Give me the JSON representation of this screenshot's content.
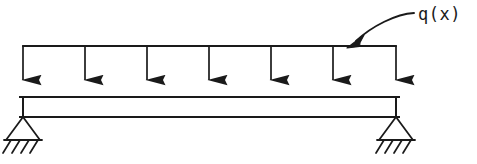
{
  "figure": {
    "kind": "structural-engineering-beam-diagram",
    "background_color": "#ffffff",
    "ink_color": "#1a1a1a"
  },
  "annotations": {
    "load_label": "q(x)",
    "load_label_x": 418,
    "load_label_y": 6
  },
  "beam": {
    "name": "beam",
    "left_x": 23,
    "right_x": 396,
    "top_y": 97,
    "bottom_y": 117,
    "stroke_width": 2.0
  },
  "load": {
    "name": "uniformly-distributed-load",
    "symbol": "q(x)",
    "distribution": "uniform",
    "direction": "downward",
    "top_line_y": 46,
    "left_x": 23,
    "right_x": 396,
    "arrow_count": 7,
    "arrow_x_positions": [
      23,
      85,
      147,
      209,
      271,
      333,
      396
    ],
    "arrow_tip_y": 97,
    "arrow_head_width": 11,
    "arrow_head_height": 20,
    "stroke_width": 1.6
  },
  "supports": [
    {
      "name": "support-left",
      "type": "pinned",
      "apex_x": 23,
      "apex_y": 117,
      "half_width": 17,
      "height": 23,
      "ground_y": 140,
      "hatch_count": 4,
      "hatch_length": 14,
      "hatch_angle_dx": -9
    },
    {
      "name": "support-right",
      "type": "pinned",
      "apex_x": 396,
      "apex_y": 117,
      "half_width": 17,
      "height": 23,
      "ground_y": 140,
      "hatch_count": 4,
      "hatch_length": 14,
      "hatch_angle_dx": -9
    }
  ],
  "leader": {
    "name": "load-label-leader",
    "start_x": 414,
    "start_y": 13,
    "control_x": 392,
    "control_y": 17,
    "end_x": 355,
    "end_y": 41,
    "arrow_tip_x": 348,
    "arrow_tip_y": 47,
    "stroke_width": 1.8
  }
}
